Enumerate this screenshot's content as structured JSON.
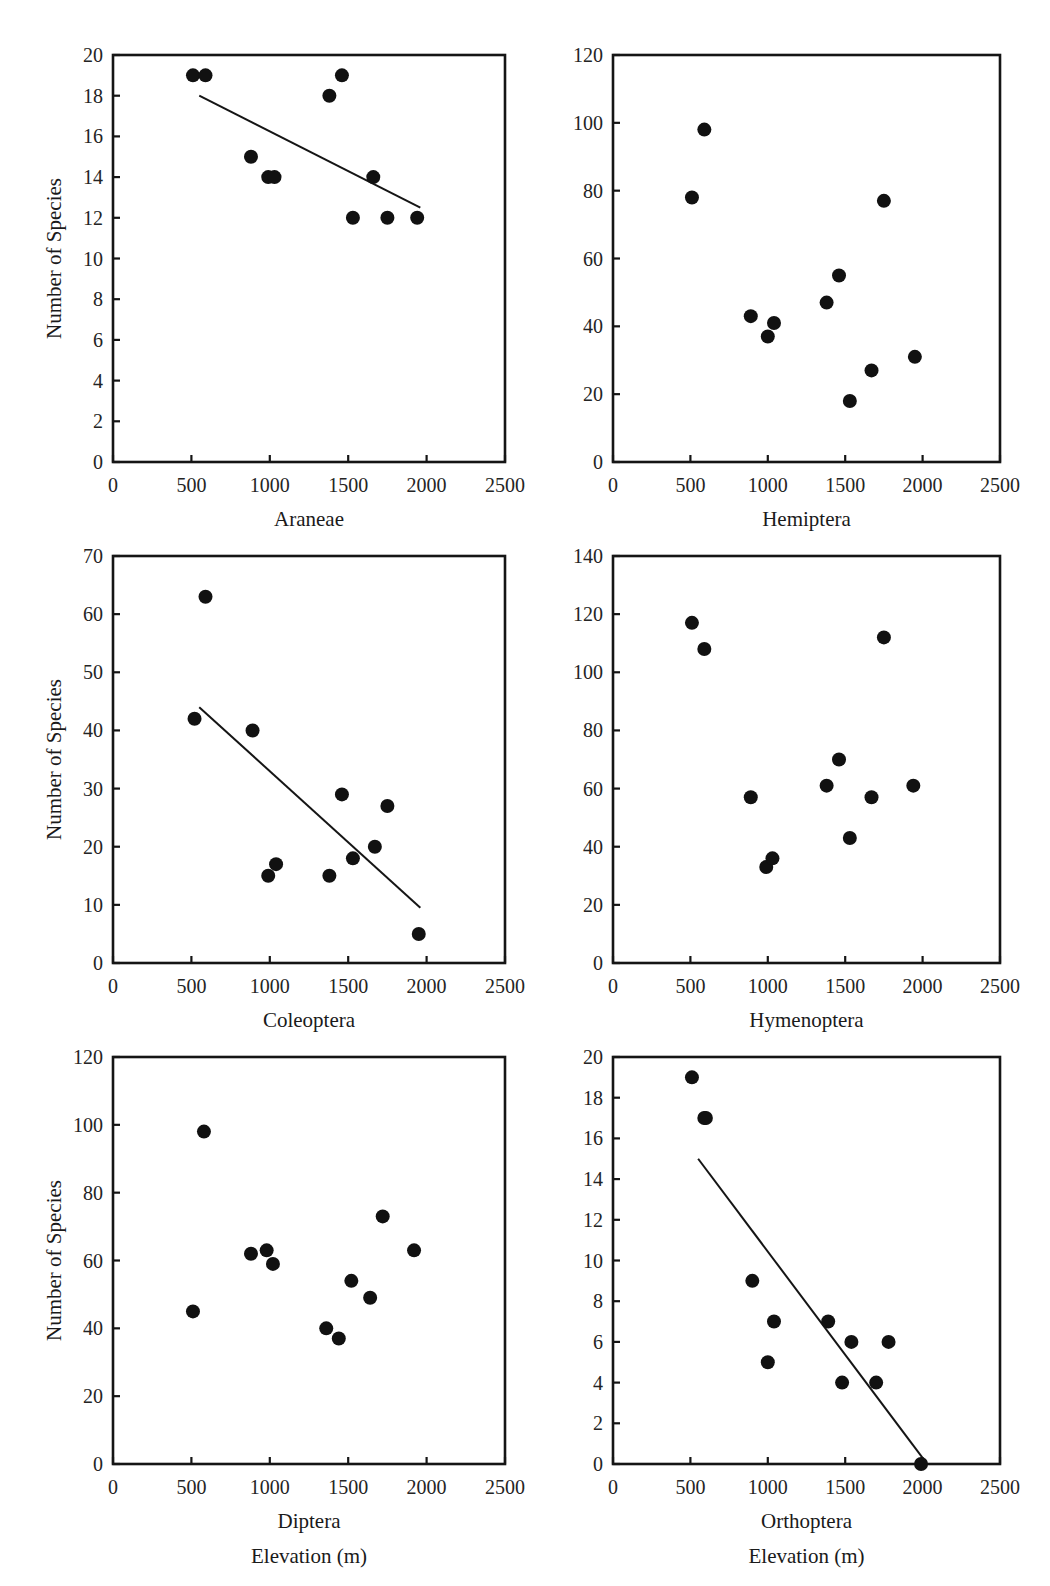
{
  "figure": {
    "shared_ylabel": "Number of Species",
    "shared_xlabel": "Elevation (m)",
    "x_ticks": [
      0,
      500,
      1000,
      1500,
      2000,
      2500
    ],
    "x_tick_labels": [
      "0",
      "500",
      "1000",
      "1500",
      "2000",
      "2500"
    ],
    "xlim": [
      0,
      2500
    ],
    "point_color": "#111111",
    "axis_color": "#151515",
    "background": "#ffffff"
  },
  "chart_data": [
    {
      "id": "araneae",
      "type": "scatter",
      "title": "",
      "xlabel": "Araneae",
      "ylabel": "Number of Species",
      "xlim": [
        0,
        2500
      ],
      "ylim": [
        0,
        20
      ],
      "y_ticks": [
        0,
        2,
        4,
        6,
        8,
        10,
        12,
        14,
        16,
        18,
        20
      ],
      "y_tick_labels": [
        "0",
        "2",
        "4",
        "6",
        "8",
        "10",
        "12",
        "14",
        "16",
        "18",
        "20"
      ],
      "grid": false,
      "legend": "none",
      "x": [
        510,
        590,
        880,
        990,
        1030,
        1380,
        1460,
        1530,
        1660,
        1750,
        1940
      ],
      "y": [
        19,
        19,
        15,
        14,
        14,
        18,
        19,
        12,
        14,
        12,
        12
      ],
      "trend_line": {
        "x0": 550,
        "y0": 18.0,
        "x1": 1960,
        "y1": 12.5
      }
    },
    {
      "id": "hemiptera",
      "type": "scatter",
      "title": "",
      "xlabel": "Hemiptera",
      "ylabel": "Number of Species",
      "xlim": [
        0,
        2500
      ],
      "ylim": [
        0,
        120
      ],
      "y_ticks": [
        0,
        20,
        40,
        60,
        80,
        100,
        120
      ],
      "y_tick_labels": [
        "0",
        "20",
        "40",
        "60",
        "80",
        "100",
        "120"
      ],
      "grid": false,
      "legend": "none",
      "x": [
        510,
        590,
        890,
        1000,
        1040,
        1380,
        1460,
        1530,
        1670,
        1750,
        1950
      ],
      "y": [
        78,
        98,
        43,
        37,
        41,
        47,
        55,
        18,
        27,
        77,
        31
      ],
      "trend_line": null
    },
    {
      "id": "coleoptera",
      "type": "scatter",
      "title": "",
      "xlabel": "Coleoptera",
      "ylabel": "Number of Species",
      "xlim": [
        0,
        2500
      ],
      "ylim": [
        0,
        70
      ],
      "y_ticks": [
        0,
        10,
        20,
        30,
        40,
        50,
        60,
        70
      ],
      "y_tick_labels": [
        "0",
        "10",
        "20",
        "30",
        "40",
        "50",
        "60",
        "70"
      ],
      "grid": false,
      "legend": "none",
      "x": [
        520,
        590,
        890,
        990,
        1040,
        1380,
        1460,
        1530,
        1670,
        1750,
        1950
      ],
      "y": [
        42,
        63,
        40,
        15,
        17,
        15,
        29,
        18,
        20,
        27,
        5
      ],
      "trend_line": {
        "x0": 550,
        "y0": 44.0,
        "x1": 1960,
        "y1": 9.5
      }
    },
    {
      "id": "hymenoptera",
      "type": "scatter",
      "title": "",
      "xlabel": "Hymenoptera",
      "ylabel": "Number of Species",
      "xlim": [
        0,
        2500
      ],
      "ylim": [
        0,
        140
      ],
      "y_ticks": [
        0,
        20,
        40,
        60,
        80,
        100,
        120,
        140
      ],
      "y_tick_labels": [
        "0",
        "20",
        "40",
        "60",
        "80",
        "100",
        "120",
        "140"
      ],
      "grid": false,
      "legend": "none",
      "x": [
        510,
        590,
        890,
        990,
        1030,
        1380,
        1460,
        1530,
        1670,
        1750,
        1940
      ],
      "y": [
        117,
        108,
        57,
        33,
        36,
        61,
        70,
        43,
        57,
        112,
        61
      ],
      "trend_line": null
    },
    {
      "id": "diptera",
      "type": "scatter",
      "title": "",
      "xlabel": "Diptera",
      "ylabel": "Number of Species",
      "xlim": [
        0,
        2500
      ],
      "ylim": [
        0,
        120
      ],
      "y_ticks": [
        0,
        20,
        40,
        60,
        80,
        100,
        120
      ],
      "y_tick_labels": [
        "0",
        "20",
        "40",
        "60",
        "80",
        "100",
        "120"
      ],
      "grid": false,
      "legend": "none",
      "x": [
        510,
        580,
        880,
        980,
        1020,
        1360,
        1440,
        1520,
        1640,
        1720,
        1920
      ],
      "y": [
        45,
        98,
        62,
        63,
        59,
        40,
        37,
        54,
        49,
        73,
        63
      ],
      "trend_line": null
    },
    {
      "id": "orthoptera",
      "type": "scatter",
      "title": "",
      "xlabel": "Orthoptera",
      "ylabel": "Number of Species",
      "xlim": [
        0,
        2500
      ],
      "ylim": [
        0,
        20
      ],
      "y_ticks": [
        0,
        2,
        4,
        6,
        8,
        10,
        12,
        14,
        16,
        18,
        20
      ],
      "y_tick_labels": [
        "0",
        "2",
        "4",
        "6",
        "8",
        "10",
        "12",
        "14",
        "16",
        "18",
        "20"
      ],
      "grid": false,
      "legend": "none",
      "x": [
        510,
        590,
        600,
        900,
        1000,
        1040,
        1390,
        1480,
        1540,
        1700,
        1780,
        1990
      ],
      "y": [
        19,
        17,
        17,
        9,
        5,
        7,
        7,
        4,
        6,
        4,
        6,
        0
      ],
      "trend_line": {
        "x0": 550,
        "y0": 15.0,
        "x1": 2000,
        "y1": 0.3
      }
    }
  ]
}
